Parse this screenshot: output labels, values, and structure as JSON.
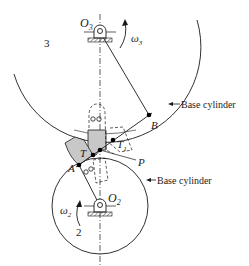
{
  "labels": {
    "o3": "O",
    "o3_sub": "3",
    "omega3": "ω",
    "omega3_sub": "3",
    "gear3": "3",
    "base_cylinder_top": "Base cylinder",
    "b": "B",
    "t1": "T",
    "t1_sub": "1",
    "t": "T",
    "p": "P",
    "a": "A",
    "base_cylinder_bottom": "Base cylinder",
    "o2": "O",
    "o2_sub": "2",
    "omega2": "ω",
    "omega2_sub": "2",
    "gear2": "2"
  },
  "colors": {
    "line": "#1a1a1a",
    "tooth_fill": "#c8c8c8",
    "hatch": "#555555"
  },
  "geometry": {
    "gear3_center": [
      100,
      32
    ],
    "gear3_base_radius": 95,
    "gear2_center": [
      100,
      206
    ],
    "gear2_base_radius": 48,
    "point_B": [
      149,
      115
    ],
    "point_T1": [
      113,
      140
    ],
    "point_pitch": [
      100,
      150
    ],
    "point_T": [
      93,
      155
    ],
    "point_A": [
      79,
      165
    ]
  }
}
